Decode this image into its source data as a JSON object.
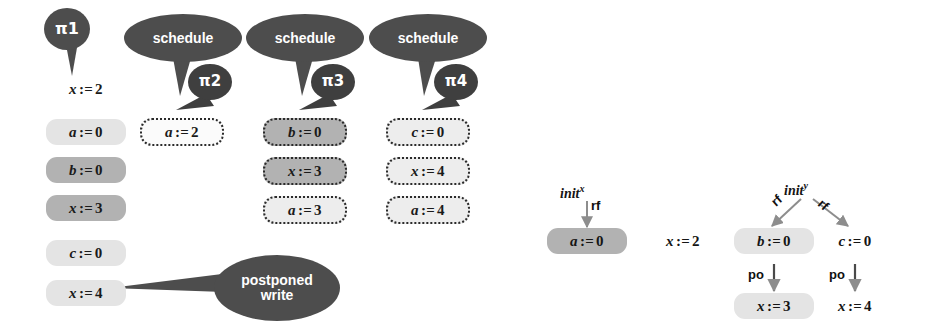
{
  "figure": {
    "caption_parts": {
      "op_assign": ":="
    }
  },
  "left_panel": {
    "bubbles": [
      {
        "name": "pi1",
        "label": "π1",
        "kind": "thread-label"
      },
      {
        "name": "schedule1",
        "label": "schedule",
        "kind": "action"
      },
      {
        "name": "pi2",
        "label": "π2",
        "kind": "thread-label"
      },
      {
        "name": "schedule2",
        "label": "schedule",
        "kind": "action"
      },
      {
        "name": "pi3",
        "label": "π3",
        "kind": "thread-label"
      },
      {
        "name": "schedule3",
        "label": "schedule",
        "kind": "action"
      },
      {
        "name": "pi4",
        "label": "π4",
        "kind": "thread-label"
      },
      {
        "name": "postponed",
        "label": "postponed write",
        "line1": "postponed",
        "line2": "write",
        "kind": "annotation"
      }
    ],
    "columns": [
      {
        "name": "trace-pi1",
        "thread": "π1",
        "statements": [
          {
            "var": "x",
            "op": ":=",
            "val": "2",
            "fill": "none",
            "border": "none"
          },
          {
            "var": "a",
            "op": ":=",
            "val": "0",
            "fill": "light",
            "border": "none"
          },
          {
            "var": "b",
            "op": ":=",
            "val": "0",
            "fill": "mid",
            "border": "none"
          },
          {
            "var": "x",
            "op": ":=",
            "val": "3",
            "fill": "mid",
            "border": "none"
          },
          {
            "var": "c",
            "op": ":=",
            "val": "0",
            "fill": "light",
            "border": "none"
          },
          {
            "var": "x",
            "op": ":=",
            "val": "4",
            "fill": "light",
            "border": "none"
          }
        ]
      },
      {
        "name": "trace-pi2",
        "thread": "π2",
        "statements": [
          {
            "var": "a",
            "op": ":=",
            "val": "2",
            "fill": "white",
            "border": "dotted"
          }
        ]
      },
      {
        "name": "trace-pi3",
        "thread": "π3",
        "statements": [
          {
            "var": "b",
            "op": ":=",
            "val": "0",
            "fill": "mid",
            "border": "dotted"
          },
          {
            "var": "x",
            "op": ":=",
            "val": "3",
            "fill": "mid",
            "border": "dotted"
          },
          {
            "var": "a",
            "op": ":=",
            "val": "3",
            "fill": "light",
            "border": "dotted"
          }
        ]
      },
      {
        "name": "trace-pi4",
        "thread": "π4",
        "statements": [
          {
            "var": "c",
            "op": ":=",
            "val": "0",
            "fill": "light",
            "border": "dotted"
          },
          {
            "var": "x",
            "op": ":=",
            "val": "4",
            "fill": "light",
            "border": "dotted"
          },
          {
            "var": "a",
            "op": ":=",
            "val": "4",
            "fill": "light",
            "border": "dotted"
          }
        ]
      }
    ]
  },
  "right_panel": {
    "name": "execution-graph",
    "init_nodes": [
      {
        "name": "init-x",
        "base": "init",
        "sup": "x"
      },
      {
        "name": "init-y",
        "base": "init",
        "sup": "y"
      }
    ],
    "edge_labels": {
      "rf": "rf",
      "po": "po"
    },
    "edges": [
      {
        "from": "init-x",
        "to": "a-assign-0",
        "label": "rf"
      },
      {
        "from": "init-y",
        "to": "b-assign-0",
        "label": "rf"
      },
      {
        "from": "init-y",
        "to": "c-assign-0",
        "label": "rf"
      },
      {
        "from": "b-assign-0",
        "to": "x-assign-3",
        "label": "po"
      },
      {
        "from": "c-assign-0",
        "to": "x-assign-4",
        "label": "po"
      }
    ],
    "nodes": [
      {
        "name": "a-assign-0",
        "var": "a",
        "op": ":=",
        "val": "0",
        "fill": "mid"
      },
      {
        "name": "x-assign-2",
        "var": "x",
        "op": ":=",
        "val": "2",
        "fill": "none"
      },
      {
        "name": "b-assign-0",
        "var": "b",
        "op": ":=",
        "val": "0",
        "fill": "light"
      },
      {
        "name": "c-assign-0",
        "var": "c",
        "op": ":=",
        "val": "0",
        "fill": "none"
      },
      {
        "name": "x-assign-3",
        "var": "x",
        "op": ":=",
        "val": "3",
        "fill": "light"
      },
      {
        "name": "x-assign-4",
        "var": "x",
        "op": ":=",
        "val": "4",
        "fill": "none"
      }
    ]
  },
  "colors": {
    "bubble_dark": "#4d4d4d",
    "bubble_small": "#3f3f3f",
    "fill_light": "#e4e4e4",
    "fill_mid": "#b2b2b2",
    "text": "#1a1a1a",
    "arrow": "#8a8a8a",
    "page_bg": "#ffffff"
  }
}
